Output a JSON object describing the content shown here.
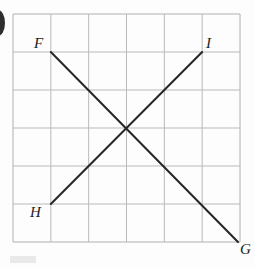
{
  "figure": {
    "background_color": "#fdfdfd",
    "width": 255,
    "height": 267
  },
  "grid": {
    "line_color": "#b9b9b9",
    "border_color": "#b0b0b0",
    "columns": 6,
    "rows": 6,
    "left": 13,
    "top": 14,
    "right": 240,
    "bottom": 242,
    "cell_size": 37.83,
    "x_positions": [
      13,
      50.83,
      88.67,
      126.5,
      164.33,
      202.17,
      240
    ],
    "y_positions": [
      14,
      52,
      90,
      128,
      166,
      204,
      242
    ]
  },
  "segments": [
    {
      "id": "FG",
      "name": "segment-fg",
      "color": "#262626",
      "stroke_width": 2,
      "from": {
        "label": "F",
        "x": 50.83,
        "y": 52,
        "grid_col": 1,
        "grid_row": 1
      },
      "to": {
        "label": "G",
        "x": 238,
        "y": 242,
        "grid_col": 6,
        "grid_row": 6
      }
    },
    {
      "id": "HI",
      "name": "segment-hi",
      "color": "#262626",
      "stroke_width": 2,
      "from": {
        "label": "H",
        "x": 50.83,
        "y": 204,
        "grid_col": 1,
        "grid_row": 5
      },
      "to": {
        "label": "I",
        "x": 202.17,
        "y": 52,
        "grid_col": 5,
        "grid_row": 1
      }
    }
  ],
  "labels": {
    "F": "F",
    "G": "G",
    "H": "H",
    "I": "I"
  },
  "marks": {
    "page_edge_color": "#2e2e2e",
    "smudge_color": "#e9e9e9"
  }
}
